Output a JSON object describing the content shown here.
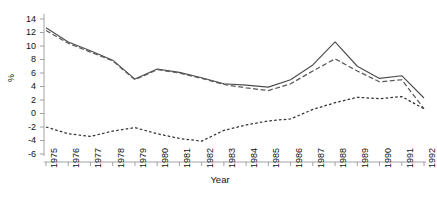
{
  "chart_data": {
    "type": "line",
    "title": "",
    "subtitle": "",
    "xlabel": "Year",
    "ylabel": "%",
    "grid": false,
    "legend": "none",
    "x": [
      1975,
      1976,
      1977,
      1978,
      1979,
      1980,
      1981,
      1982,
      1983,
      1984,
      1985,
      1986,
      1987,
      1988,
      1989,
      1990,
      1991,
      1992
    ],
    "xtick_labels": [
      "1975",
      "1976",
      "1977",
      "1978",
      "1979",
      "1980",
      "1981",
      "1982",
      "1983",
      "1984",
      "1985",
      "1986",
      "1987",
      "1988",
      "1989",
      "1990",
      "1991",
      "1992"
    ],
    "ytick_labels": [
      "14",
      "12",
      "10",
      "8",
      "6",
      "4",
      "2",
      "0",
      "-2",
      "-4",
      "-6"
    ],
    "ytick_values": [
      14,
      12,
      10,
      8,
      6,
      4,
      2,
      0,
      -2,
      -4,
      -6
    ],
    "xlim": [
      1975,
      1992
    ],
    "ylim": [
      -6,
      14
    ],
    "series": [
      {
        "name": "solid-line",
        "style": "solid",
        "color": "#4d4d4d",
        "values": [
          12.7,
          10.6,
          9.3,
          7.9,
          5.1,
          6.6,
          6.1,
          5.3,
          4.4,
          4.2,
          3.9,
          5.0,
          7.2,
          10.6,
          7.0,
          5.2,
          5.6,
          2.3
        ]
      },
      {
        "name": "dashed-line",
        "style": "dashed",
        "color": "#5a5a5a",
        "values": [
          12.3,
          10.4,
          9.1,
          7.8,
          5.0,
          6.5,
          6.0,
          5.2,
          4.3,
          3.8,
          3.4,
          4.4,
          6.3,
          8.1,
          6.3,
          4.7,
          5.0,
          0.7
        ]
      },
      {
        "name": "dotted-line",
        "style": "dotted",
        "color": "#333333",
        "values": [
          -2.0,
          -3.0,
          -3.4,
          -2.6,
          -2.1,
          -3.0,
          -3.7,
          -4.1,
          -2.5,
          -1.7,
          -1.1,
          -0.8,
          0.6,
          1.6,
          2.4,
          2.2,
          2.5,
          0.7
        ]
      }
    ]
  }
}
